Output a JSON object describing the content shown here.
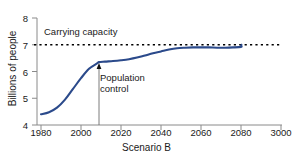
{
  "chart_data": {
    "type": "line",
    "title": "",
    "xlabel": "Scenario B",
    "ylabel": "Billions of people",
    "xlim": [
      1980,
      3000
    ],
    "ylim": [
      4,
      8
    ],
    "xticks": [
      "1980",
      "2000",
      "2020",
      "2040",
      "2060",
      "2080",
      "3000"
    ],
    "xtick_values": [
      1980,
      2000,
      2020,
      2040,
      2060,
      2080,
      3000
    ],
    "yticks": [
      "4",
      "5",
      "6",
      "7",
      "8"
    ],
    "ytick_values": [
      4,
      5,
      6,
      7,
      8
    ],
    "grid": false,
    "legend": "none",
    "series": [
      {
        "name": "Population",
        "color": "#2b4a8b",
        "style": "solid",
        "x": [
          1980,
          1984,
          1988,
          1992,
          1996,
          2000,
          2004,
          2008,
          2009,
          2012,
          2016,
          2020,
          2024,
          2028,
          2032,
          2036,
          2040,
          2044,
          2048,
          2052,
          2056,
          2060,
          2064,
          2068,
          2072,
          2076,
          2080,
          2084,
          2088,
          2090
        ],
        "y": [
          4.4,
          4.48,
          4.65,
          4.95,
          5.35,
          5.75,
          6.1,
          6.3,
          6.35,
          6.37,
          6.39,
          6.42,
          6.46,
          6.52,
          6.6,
          6.68,
          6.75,
          6.82,
          6.87,
          6.89,
          6.9,
          6.9,
          6.9,
          6.89,
          6.89,
          6.9,
          6.92,
          6.96,
          6.99,
          7.0
        ]
      },
      {
        "name": "Carrying capacity",
        "color": "#000000",
        "style": "dotted",
        "value": 7.0
      }
    ],
    "annotations": [
      {
        "name": "carrying-capacity",
        "text": "Carrying capacity",
        "x": 1980,
        "y": 7.0
      },
      {
        "name": "population-control",
        "text_lines": [
          "Population",
          "control"
        ],
        "x": 2009,
        "y": 6.3,
        "arrow": "up"
      }
    ]
  },
  "labels": {
    "ylabel": "Billions of people",
    "xlabel": "Scenario B",
    "carrying_capacity": "Carrying capacity",
    "population_control_line1": "Population",
    "population_control_line2": "control"
  },
  "colors": {
    "curve": "#2b4a8b",
    "axis": "#808080",
    "text": "#1a1a1a",
    "dotted": "#000000",
    "background": "#ffffff"
  }
}
